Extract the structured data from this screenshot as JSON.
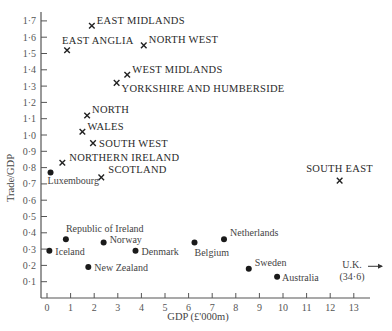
{
  "chart_data": {
    "type": "scatter",
    "title": "",
    "xlabel": "GDP (£'000m)",
    "ylabel": "Trade/GDP",
    "xlim": [
      0,
      13.6
    ],
    "ylim": [
      0,
      1.75
    ],
    "x_ticks": [
      "0",
      "1",
      "2",
      "3",
      "4",
      "5",
      "6",
      "7",
      "8",
      "9",
      "10",
      "11",
      "12",
      "13"
    ],
    "y_ticks": [
      "0·1",
      "0·2",
      "0·3",
      "0·4",
      "0·5",
      "0·6",
      "0·7",
      "0·8",
      "0·9",
      "1·0",
      "1·1",
      "1·2",
      "1·3",
      "1·4",
      "1·5",
      "1·6",
      "1·7"
    ],
    "grid": false,
    "legend": null,
    "series": [
      {
        "name": "UK regions",
        "marker": "x",
        "points": [
          {
            "label": "EAST MIDLANDS",
            "x": 1.9,
            "y": 1.67
          },
          {
            "label": "EAST ANGLIA",
            "x": 0.85,
            "y": 1.52
          },
          {
            "label": "NORTH WEST",
            "x": 4.1,
            "y": 1.55
          },
          {
            "label": "WEST MIDLANDS",
            "x": 3.4,
            "y": 1.37
          },
          {
            "label": "YORKSHIRE AND HUMBERSIDE",
            "x": 2.95,
            "y": 1.32
          },
          {
            "label": "NORTH",
            "x": 1.7,
            "y": 1.12
          },
          {
            "label": "WALES",
            "x": 1.5,
            "y": 1.02
          },
          {
            "label": "SOUTH WEST",
            "x": 1.95,
            "y": 0.95
          },
          {
            "label": "NORTHERN IRELAND",
            "x": 0.65,
            "y": 0.83
          },
          {
            "label": "SCOTLAND",
            "x": 2.3,
            "y": 0.74
          },
          {
            "label": "SOUTH EAST",
            "x": 12.4,
            "y": 0.72
          }
        ]
      },
      {
        "name": "Countries",
        "marker": "dot",
        "points": [
          {
            "label": "Luxembourg",
            "x": 0.15,
            "y": 0.77
          },
          {
            "label": "Republic of Ireland",
            "x": 0.8,
            "y": 0.36
          },
          {
            "label": "Iceland",
            "x": 0.1,
            "y": 0.29
          },
          {
            "label": "Norway",
            "x": 2.4,
            "y": 0.34
          },
          {
            "label": "Denmark",
            "x": 3.75,
            "y": 0.29
          },
          {
            "label": "New Zealand",
            "x": 1.75,
            "y": 0.19
          },
          {
            "label": "Belgium",
            "x": 6.25,
            "y": 0.34
          },
          {
            "label": "Netherlands",
            "x": 7.5,
            "y": 0.36
          },
          {
            "label": "Sweden",
            "x": 8.55,
            "y": 0.18
          },
          {
            "label": "Australia",
            "x": 9.75,
            "y": 0.13
          }
        ]
      }
    ],
    "annotations": [
      {
        "text": "U.K.",
        "subtext": "(34·6)",
        "note": "off-scale arrow pointing right",
        "y": 0.17
      }
    ]
  },
  "labels": {
    "xlabel": "GDP (£'000m)",
    "ylabel": "Trade/GDP",
    "uk_label": "U.K.",
    "uk_value": "(34·6)"
  }
}
